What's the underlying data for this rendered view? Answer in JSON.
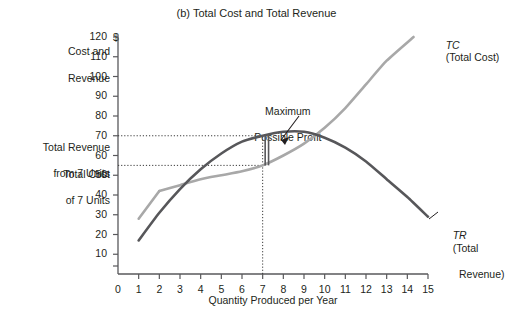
{
  "figure": {
    "title": "(b) Total Cost and Total Revenue",
    "y_axis_title_line1": "Cost and",
    "y_axis_title_line2": "Revenue",
    "currency_symbol": "$",
    "x_axis_title": "Quantity Produced per Year"
  },
  "annotations": {
    "max_profit_line1": "Maximum",
    "max_profit_line2": "Possible Profit",
    "total_revenue_7_line1": "Total Revenue",
    "total_revenue_7_line2": "from 7 Units",
    "total_cost_7_line1": "Total Cost",
    "total_cost_7_line2": "of 7 Units"
  },
  "legend": {
    "tc_symbol": "TC",
    "tc_name": "(Total Cost)",
    "tr_symbol": "TR",
    "tr_name_line1": "(Total",
    "tr_name_line2": "Revenue)"
  },
  "colors": {
    "total_cost_curve": "#a8a8a8",
    "total_revenue_curve": "#57575a",
    "axis": "#58585b",
    "text": "#231f20",
    "guide_line": "#3a3a3a"
  },
  "chart_data": {
    "type": "line",
    "title": "(b) Total Cost and Total Revenue",
    "xlabel": "Quantity Produced per Year",
    "ylabel": "Cost and Revenue ($)",
    "xlim": [
      0,
      15
    ],
    "ylim": [
      0,
      120
    ],
    "grid": false,
    "legend_position": "curve-end-labels",
    "xticks": [
      0,
      1,
      2,
      3,
      4,
      5,
      6,
      7,
      8,
      9,
      10,
      11,
      12,
      13,
      14,
      15
    ],
    "xtick_labels": [
      "0",
      "1",
      "2",
      "3",
      "4",
      "5",
      "6",
      "7",
      "8",
      "9",
      "10",
      "11",
      "12",
      "13",
      "14",
      "15"
    ],
    "yticks": [
      10,
      20,
      30,
      40,
      50,
      60,
      70,
      80,
      90,
      100,
      110,
      120
    ],
    "ytick_labels": [
      "10",
      "20",
      "30",
      "40",
      "50",
      "60",
      "70",
      "80",
      "90",
      "100",
      "110",
      "120"
    ],
    "x": [
      1,
      2,
      3,
      4,
      5,
      6,
      7,
      8,
      9,
      10,
      11,
      12,
      13,
      14,
      15
    ],
    "series": [
      {
        "name": "TC (Total Cost)",
        "color": "#a8a8a8",
        "x": [
          1,
          2,
          3,
          4,
          5,
          6,
          7,
          8,
          9,
          10,
          11,
          12,
          13,
          14.3
        ],
        "values": [
          28,
          42,
          45,
          48,
          50,
          52,
          55,
          60,
          66,
          74,
          84,
          96,
          108,
          120
        ]
      },
      {
        "name": "TR (Total Revenue)",
        "color": "#57575a",
        "x": [
          1,
          2,
          3,
          4,
          5,
          6,
          7,
          8,
          9,
          10,
          11,
          12,
          13,
          14,
          15
        ],
        "values": [
          17,
          31,
          43,
          53,
          61,
          67,
          70,
          72,
          72,
          69,
          64,
          57,
          48,
          39,
          29
        ]
      }
    ],
    "annotations": [
      {
        "label": "Maximum Possible Profit",
        "x": 7,
        "y_from": 55,
        "y_to": 70
      },
      {
        "label": "Total Revenue from 7 Units",
        "axis": "y",
        "value": 70
      },
      {
        "label": "Total Cost of 7 Units",
        "axis": "y",
        "value": 55
      }
    ],
    "guides": [
      {
        "type": "hline",
        "y": 70,
        "x_from": 0,
        "x_to": 7,
        "style": "dotted"
      },
      {
        "type": "hline",
        "y": 55,
        "x_from": 0,
        "x_to": 7,
        "style": "dotted"
      },
      {
        "type": "vline",
        "x": 7,
        "y_from": 0,
        "y_to": 70,
        "style": "dotted"
      }
    ]
  }
}
